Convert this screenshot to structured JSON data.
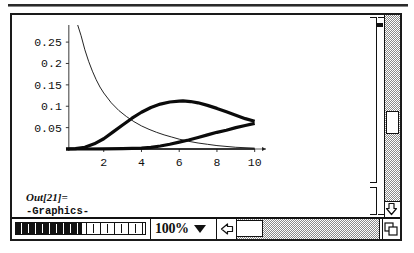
{
  "window": {
    "kind": "mathematica-notebook-window"
  },
  "cells": {
    "graphic_bracket_name": "graphics-cell-bracket",
    "output": {
      "label": "Out[21]=",
      "value": "-Graphics-"
    }
  },
  "bottom_bar": {
    "zoom_value": "100%",
    "zoom_caret_icon": "chevron-down-icon",
    "left_arrow_icon": "arrow-left-icon",
    "right_arrow_icon": "arrow-right-icon",
    "grow_box_icon": "resize-corner-icon",
    "ruler_filled_ticks": 9,
    "ruler_empty_ticks": 9
  },
  "scrollbars": {
    "vertical_down_arrow_icon": "arrow-down-icon",
    "vertical_thumb_position_pct": 48,
    "horizontal_thumb_position_pct": 0
  },
  "chart_data": {
    "type": "line",
    "title": "",
    "xlabel": "",
    "ylabel": "",
    "xlim": [
      0,
      10.6
    ],
    "ylim": [
      0,
      0.29
    ],
    "grid": false,
    "legend": null,
    "xticks": [
      2,
      4,
      6,
      8,
      10
    ],
    "yticks": [
      0.05,
      0.1,
      0.15,
      0.2,
      0.25
    ],
    "ytick_labels": [
      "0.05",
      "0.1",
      "0.15",
      "0.2",
      "0.25"
    ],
    "xtick_labels": [
      "2",
      "4",
      "6",
      "8",
      "10"
    ],
    "series": [
      {
        "name": "decaying-curve",
        "style": "thin",
        "x": [
          0.62,
          0.8,
          1.0,
          1.2,
          1.4,
          1.6,
          1.8,
          2.0,
          2.4,
          2.8,
          3.2,
          3.6,
          4.0,
          4.4,
          4.8,
          5.2,
          5.6,
          6.0,
          6.5,
          7.0,
          7.5,
          8.0,
          9.0,
          10.0
        ],
        "y": [
          0.29,
          0.265,
          0.232,
          0.205,
          0.182,
          0.162,
          0.145,
          0.131,
          0.108,
          0.09,
          0.076,
          0.064,
          0.054,
          0.046,
          0.039,
          0.033,
          0.028,
          0.023,
          0.018,
          0.014,
          0.011,
          0.008,
          0.004,
          0.002
        ]
      },
      {
        "name": "hump-curve",
        "style": "thick",
        "x": [
          0.0,
          0.5,
          1.0,
          1.5,
          2.0,
          2.5,
          3.0,
          3.5,
          4.0,
          4.5,
          5.0,
          5.5,
          6.0,
          6.2,
          6.6,
          7.0,
          7.5,
          8.0,
          8.5,
          9.0,
          9.5,
          10.0
        ],
        "y": [
          0.0,
          0.001,
          0.004,
          0.012,
          0.024,
          0.04,
          0.056,
          0.072,
          0.086,
          0.097,
          0.105,
          0.11,
          0.112,
          0.1125,
          0.111,
          0.108,
          0.102,
          0.095,
          0.087,
          0.079,
          0.071,
          0.065
        ]
      },
      {
        "name": "rising-curve",
        "style": "thick",
        "x": [
          0.0,
          1.0,
          2.0,
          3.0,
          4.0,
          4.5,
          5.0,
          5.5,
          6.0,
          6.5,
          7.0,
          7.5,
          8.0,
          8.5,
          9.0,
          9.5,
          10.0
        ],
        "y": [
          0.0,
          0.0,
          0.0005,
          0.001,
          0.002,
          0.004,
          0.007,
          0.011,
          0.016,
          0.021,
          0.027,
          0.033,
          0.039,
          0.044,
          0.05,
          0.055,
          0.06
        ]
      },
      {
        "name": "baseline-curve",
        "style": "hairline",
        "x": [
          0.0,
          10.0
        ],
        "y": [
          0.0,
          0.0
        ]
      }
    ]
  }
}
